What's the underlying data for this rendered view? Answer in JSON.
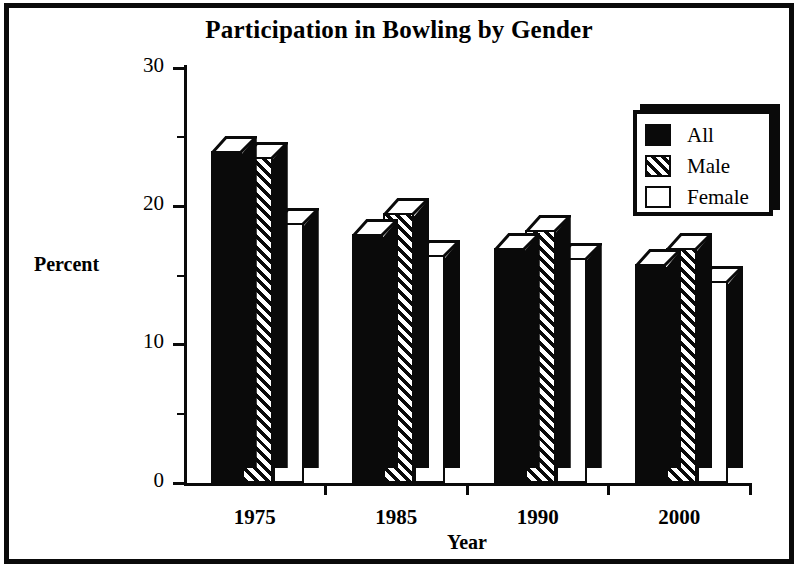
{
  "chart_data": {
    "type": "bar",
    "title": "Participation in Bowling by Gender",
    "xlabel": "Year",
    "ylabel": "Percent",
    "categories": [
      "1975",
      "1985",
      "1990",
      "2000"
    ],
    "series": [
      {
        "name": "All",
        "values": [
          24.0,
          18.0,
          17.0,
          15.8
        ],
        "pattern": "solid-black"
      },
      {
        "name": "Male",
        "values": [
          23.6,
          19.5,
          18.3,
          17.0
        ],
        "pattern": "diagonal-hatch"
      },
      {
        "name": "Female",
        "values": [
          18.8,
          16.5,
          16.3,
          14.6
        ],
        "pattern": "dotted-checker"
      }
    ],
    "ylim": [
      0,
      30
    ],
    "ytick_labels": [
      "0",
      "10",
      "20",
      "30"
    ],
    "ytick_values": [
      0,
      10,
      20,
      30
    ],
    "yminor_values": [
      5,
      15,
      25
    ],
    "grid": false,
    "legend_position": "top-right",
    "style": "3d-bars-monochrome",
    "colors": {
      "ink": "#0a0a0a",
      "background": "#ffffff"
    }
  },
  "legend": {
    "entries": [
      {
        "label": "All"
      },
      {
        "label": "Male"
      },
      {
        "label": "Female"
      }
    ]
  }
}
